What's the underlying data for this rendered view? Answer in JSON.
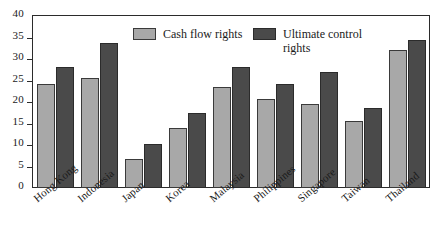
{
  "chart_data": {
    "type": "bar",
    "title": "",
    "subtitle": "",
    "xlabel": "",
    "ylabel": "",
    "ylim": [
      0,
      40
    ],
    "ytick_step": 5,
    "yticks": [
      "40",
      "35",
      "30",
      "25",
      "20",
      "15",
      "10",
      "5",
      "0"
    ],
    "ytick_values": [
      40,
      35,
      30,
      25,
      20,
      15,
      10,
      5,
      0
    ],
    "grid": false,
    "legend_position": "top-center",
    "categories": [
      "Hong Kong",
      "Indonesia",
      "Japan",
      "Korea",
      "Malaysia",
      "Philippines",
      "Singapore",
      "Taiwan",
      "Thailand"
    ],
    "series": [
      {
        "name": "Cash flow rights",
        "color": "#a8a8a8",
        "values": [
          24.3,
          25.5,
          6.8,
          13.9,
          23.5,
          20.7,
          19.5,
          15.6,
          32.2
        ]
      },
      {
        "name": "Ultimate control rights",
        "color": "#4a4a4a",
        "values": [
          28.2,
          33.7,
          10.3,
          17.5,
          28.1,
          24.3,
          26.9,
          18.5,
          34.4
        ]
      }
    ]
  },
  "legend": {
    "entries": [
      {
        "label": "Cash flow rights",
        "swatch": "light-gray-swatch"
      },
      {
        "label": "Ultimate control\nrights",
        "swatch": "dark-gray-swatch"
      }
    ]
  },
  "colors": {
    "cash_flow_rights": "#a8a8a8",
    "ultimate_control_rights": "#4a4a4a",
    "axis": "#2b2b2b",
    "background": "#ffffff",
    "text": "#1a1a1a"
  }
}
